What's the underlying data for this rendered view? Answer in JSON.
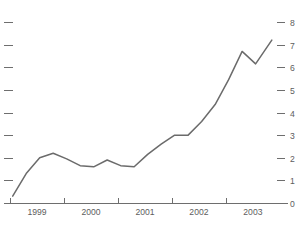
{
  "chart_data": {
    "type": "line",
    "title": "",
    "subtitle": "",
    "xlabel": "",
    "ylabel": "",
    "xlim": [
      1998.75,
      2003.9
    ],
    "ylim": [
      0,
      8
    ],
    "grid": false,
    "legend": false,
    "legend_position": "none",
    "y_ticks": [
      0,
      1,
      2,
      3,
      4,
      5,
      6,
      7,
      8
    ],
    "y_tick_labels": [
      "0",
      "1",
      "2",
      "3",
      "4",
      "5",
      "6",
      "7",
      "8"
    ],
    "y_axis_side": "right",
    "y_tick_marks_both_sides": true,
    "x_ticks": [
      1998.75,
      1999.75,
      2000.75,
      2001.75,
      2002.75
    ],
    "x_tick_labels": [
      "",
      "",
      "",
      "",
      ""
    ],
    "x_category_labels": [
      "1999",
      "2000",
      "2001",
      "2002",
      "2003"
    ],
    "line_color": "#6b6b6b",
    "axis_color": "#6e6e6e",
    "background_color": "#ffffff",
    "series": [
      {
        "name": "series-1",
        "x": [
          1998.8,
          1999.05,
          1999.3,
          1999.55,
          1999.8,
          2000.05,
          2000.3,
          2000.55,
          2000.8,
          2001.05,
          2001.3,
          2001.55,
          2001.8,
          2002.05,
          2002.3,
          2002.55,
          2002.8,
          2003.05,
          2003.3,
          2003.6
        ],
        "y": [
          0.3,
          1.3,
          2.0,
          2.2,
          1.95,
          1.65,
          1.6,
          1.9,
          1.65,
          1.6,
          2.15,
          2.6,
          3.0,
          3.0,
          3.6,
          4.35,
          5.45,
          6.7,
          6.15,
          7.2
        ]
      }
    ]
  },
  "axes": {
    "y_labels": [
      "8",
      "7",
      "6",
      "5",
      "4",
      "3",
      "2",
      "1",
      "0"
    ],
    "x_labels": [
      "1999",
      "2000",
      "2001",
      "2002",
      "2003"
    ]
  },
  "header": {
    "faint_title": ""
  }
}
